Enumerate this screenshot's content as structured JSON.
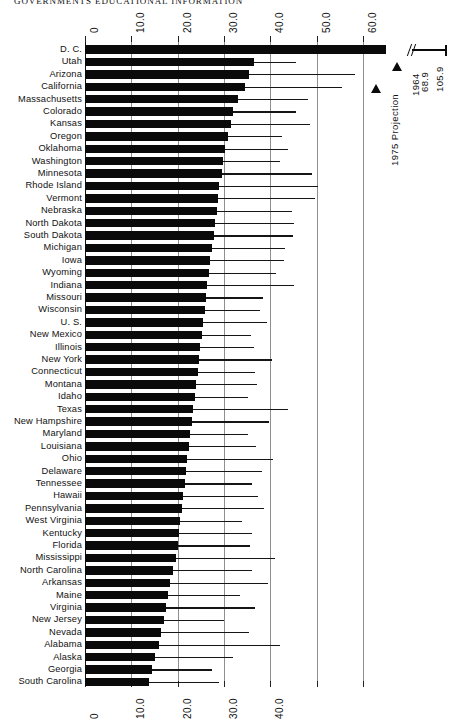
{
  "running_head": "GOVERNMENTS EDUCATIONAL INFORMATION",
  "annotations": {
    "far_value_label": "105.9",
    "bar_legend_value": "68.9",
    "legend_1964": "1964",
    "legend_1975": "1975 Projection"
  },
  "chart_data": {
    "type": "bar",
    "title": "GOVERNMENTS EDUCATIONAL INFORMATION",
    "xlabel": "",
    "ylabel": "",
    "orientation": "horizontal",
    "xlim": [
      0,
      65
    ],
    "grid": true,
    "legend_position": "right",
    "axis_top_ticks": [
      "0",
      "10.0",
      "20.0",
      "30.0",
      "40.0",
      "50.0",
      "60.0"
    ],
    "axis_bottom_ticks": [
      "0",
      "10.0",
      "20.0",
      "30.0",
      "40.0"
    ],
    "tick_values": [
      0,
      10,
      20,
      30,
      40,
      50,
      60
    ],
    "series": [
      {
        "name": "1964",
        "marker": "solid-bar"
      },
      {
        "name": "1975 Projection",
        "marker": "thin-line"
      }
    ],
    "categories": [
      "D. C.",
      "Utah",
      "Arizona",
      "California",
      "Massachusetts",
      "Colorado",
      "Kansas",
      "Oregon",
      "Oklahoma",
      "Washington",
      "Minnesota",
      "Rhode Island",
      "Vermont",
      "Nebraska",
      "North Dakota",
      "South Dakota",
      "Michigan",
      "Iowa",
      "Wyoming",
      "Indiana",
      "Missouri",
      "Wisconsin",
      "U. S.",
      "New Mexico",
      "Illinois",
      "New York",
      "Connecticut",
      "Montana",
      "Idaho",
      "Texas",
      "New Hampshire",
      "Maryland",
      "Louisiana",
      "Ohio",
      "Delaware",
      "Tennessee",
      "Hawaii",
      "Pennsylvania",
      "West Virginia",
      "Kentucky",
      "Florida",
      "Mississippi",
      "North Carolina",
      "Arkansas",
      "Maine",
      "Virginia",
      "New Jersey",
      "Nevada",
      "Alabama",
      "Alaska",
      "Georgia",
      "South Carolina"
    ],
    "values_1964": [
      68.9,
      36.5,
      35.4,
      34.6,
      33.0,
      32.0,
      31.6,
      30.8,
      30.3,
      29.8,
      29.5,
      29.0,
      28.7,
      28.4,
      28.1,
      27.8,
      27.4,
      27.0,
      26.7,
      26.4,
      26.1,
      25.8,
      25.5,
      25.2,
      24.9,
      24.6,
      24.3,
      24.0,
      23.7,
      23.4,
      23.0,
      22.7,
      22.4,
      22.1,
      21.8,
      21.5,
      21.2,
      20.9,
      20.6,
      20.3,
      20.0,
      19.6,
      19.0,
      18.3,
      17.9,
      17.5,
      17.1,
      16.5,
      16.0,
      15.2,
      14.5,
      13.9
    ],
    "values_1975": [
      105.9,
      45.6,
      58.2,
      55.5,
      48.2,
      45.5,
      48.6,
      42.5,
      43.8,
      42.2,
      48.9,
      50.3,
      49.6,
      44.6,
      45.1,
      44.9,
      43.2,
      42.9,
      41.3,
      45.2,
      38.5,
      37.8,
      39.4,
      35.9,
      36.4,
      40.3,
      36.8,
      37.2,
      35.1,
      43.8,
      39.7,
      35.2,
      37.0,
      40.5,
      38.2,
      36.0,
      37.4,
      38.6,
      33.9,
      36.0,
      35.6,
      41.0,
      36.1,
      39.5,
      33.5,
      36.6,
      30.0,
      35.5,
      42.0,
      32.0,
      27.5,
      29.0
    ]
  }
}
